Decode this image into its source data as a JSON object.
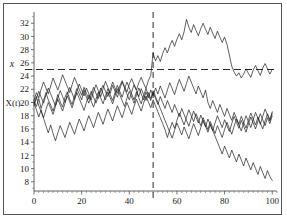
{
  "figure": {
    "background_color": "#ffffff",
    "frame_color": "#555555",
    "line_color": "#1c1c1c"
  },
  "labels": {
    "y_axis_name": "X(t)",
    "threshold_name": "x"
  },
  "chart_data": {
    "type": "line",
    "title": "",
    "xlabel": "",
    "ylabel": "X(t)",
    "xlim": [
      0,
      102
    ],
    "ylim": [
      6.6,
      33.4
    ],
    "grid": false,
    "legend": null,
    "x_ticks": [
      0,
      20,
      40,
      60,
      80,
      100
    ],
    "x_minor_tick_step": 2,
    "y_ticks": [
      8,
      10,
      12,
      14,
      16,
      18,
      20,
      22,
      24,
      26,
      28,
      30,
      32
    ],
    "y_minor_tick_step": 1,
    "annotations": [
      {
        "name": "threshold",
        "type": "hline",
        "value": 25,
        "style": "dashed",
        "label": "x"
      },
      {
        "name": "detection-time",
        "type": "vline",
        "value": 50,
        "style": "dashed",
        "label": ""
      }
    ],
    "x": [
      0,
      1,
      2,
      3,
      4,
      5,
      6,
      7,
      8,
      9,
      10,
      11,
      12,
      13,
      14,
      15,
      16,
      17,
      18,
      19,
      20,
      21,
      22,
      23,
      24,
      25,
      26,
      27,
      28,
      29,
      30,
      31,
      32,
      33,
      34,
      35,
      36,
      37,
      38,
      39,
      40,
      41,
      42,
      43,
      44,
      45,
      46,
      47,
      48,
      49,
      50,
      51,
      52,
      53,
      54,
      55,
      56,
      57,
      58,
      59,
      60,
      61,
      62,
      63,
      64,
      65,
      66,
      67,
      68,
      69,
      70,
      71,
      72,
      73,
      74,
      75,
      76,
      77,
      78,
      79,
      80,
      81,
      82,
      83,
      84,
      85,
      86,
      87,
      88,
      89,
      90,
      91,
      92,
      93,
      94,
      95,
      96,
      97,
      98,
      99,
      100
    ],
    "series": [
      {
        "name": "shifted-process",
        "values": [
          20.2,
          19.4,
          20.6,
          19.1,
          20.3,
          21.5,
          20.4,
          19.6,
          18.7,
          19.9,
          21.2,
          20.1,
          19.3,
          20.8,
          21.6,
          20.5,
          19.7,
          21.0,
          22.1,
          21.3,
          20.4,
          21.9,
          20.8,
          19.9,
          21.1,
          22.3,
          21.4,
          20.6,
          21.8,
          22.6,
          21.7,
          20.9,
          22.0,
          23.1,
          22.2,
          21.4,
          22.5,
          23.3,
          22.4,
          21.6,
          22.8,
          23.6,
          22.7,
          21.9,
          23.0,
          23.8,
          22.9,
          22.1,
          23.3,
          24.1,
          27.5,
          26.3,
          27.1,
          26.2,
          27.4,
          28.3,
          27.5,
          28.6,
          29.4,
          28.5,
          29.6,
          30.4,
          29.5,
          30.7,
          32.6,
          31.4,
          30.6,
          31.8,
          30.9,
          30.1,
          31.2,
          32.0,
          31.1,
          30.3,
          31.4,
          30.5,
          29.7,
          30.8,
          29.9,
          29.1,
          29.9,
          28.8,
          27.2,
          25.5,
          24.6,
          24.0,
          24.5,
          23.7,
          24.3,
          25.1,
          24.4,
          23.8,
          24.9,
          25.6,
          24.8,
          24.1,
          25.2,
          25.9,
          25.1,
          24.3,
          25.0
        ]
      },
      {
        "name": "in-control-a",
        "values": [
          20.3,
          21.5,
          20.7,
          22.0,
          23.1,
          22.2,
          21.3,
          22.5,
          23.7,
          22.8,
          21.9,
          23.0,
          24.2,
          23.3,
          22.4,
          21.5,
          22.7,
          23.8,
          22.9,
          22.0,
          21.1,
          22.3,
          21.4,
          20.5,
          21.7,
          20.8,
          19.9,
          21.0,
          22.2,
          21.3,
          20.4,
          21.6,
          20.7,
          19.8,
          21.0,
          22.1,
          21.2,
          20.3,
          19.4,
          20.6,
          21.7,
          20.8,
          19.9,
          21.1,
          22.2,
          21.3,
          20.4,
          21.6,
          20.7,
          21.9,
          21.0,
          22.2,
          21.3,
          22.5,
          21.6,
          20.7,
          21.9,
          23.0,
          22.1,
          21.2,
          22.4,
          23.5,
          22.6,
          21.7,
          22.9,
          24.0,
          23.1,
          22.2,
          21.3,
          22.5,
          21.6,
          20.7,
          21.9,
          20.0,
          19.1,
          20.3,
          19.4,
          18.5,
          19.7,
          18.8,
          17.9,
          19.1,
          18.2,
          17.3,
          18.5,
          17.6,
          16.7,
          17.9,
          17.0,
          16.1,
          17.3,
          18.4,
          17.5,
          16.6,
          17.8,
          16.9,
          16.0,
          17.2,
          18.3,
          17.4,
          18.6
        ]
      },
      {
        "name": "in-control-b",
        "values": [
          19.8,
          20.9,
          19.5,
          18.6,
          17.7,
          18.9,
          20.0,
          19.1,
          18.2,
          19.4,
          20.5,
          19.6,
          18.7,
          19.9,
          21.0,
          20.1,
          19.2,
          20.4,
          21.5,
          20.6,
          19.7,
          18.8,
          20.0,
          21.1,
          20.2,
          19.3,
          20.5,
          21.6,
          20.7,
          19.8,
          21.0,
          22.1,
          21.2,
          20.3,
          21.5,
          22.6,
          21.7,
          20.8,
          22.0,
          23.1,
          22.2,
          21.3,
          20.4,
          21.6,
          20.7,
          19.8,
          21.0,
          22.1,
          21.2,
          20.3,
          21.5,
          20.6,
          19.7,
          20.9,
          20.0,
          19.1,
          20.3,
          19.4,
          18.5,
          19.7,
          18.8,
          17.9,
          19.1,
          18.2,
          17.3,
          16.4,
          17.6,
          18.7,
          17.8,
          16.9,
          18.1,
          17.2,
          16.3,
          17.5,
          16.6,
          15.7,
          16.9,
          18.0,
          17.1,
          16.2,
          17.4,
          16.5,
          15.6,
          16.8,
          17.9,
          17.0,
          16.1,
          17.3,
          16.4,
          15.5,
          16.7,
          17.8,
          16.9,
          16.0,
          17.2,
          18.3,
          17.4,
          16.5,
          17.7,
          16.8,
          18.0
        ]
      },
      {
        "name": "in-control-c",
        "values": [
          20.0,
          18.9,
          17.8,
          18.9,
          17.6,
          16.5,
          15.4,
          16.6,
          15.3,
          14.2,
          15.4,
          16.5,
          15.6,
          14.7,
          15.9,
          17.0,
          16.1,
          15.2,
          16.4,
          17.5,
          16.6,
          15.7,
          16.9,
          18.0,
          17.1,
          16.2,
          17.4,
          18.5,
          17.6,
          16.7,
          17.9,
          19.0,
          18.1,
          17.2,
          18.4,
          19.5,
          18.6,
          17.7,
          18.9,
          20.0,
          19.1,
          18.2,
          19.4,
          20.5,
          19.6,
          18.7,
          19.9,
          21.0,
          20.1,
          19.2,
          20.4,
          19.5,
          18.6,
          17.7,
          16.8,
          15.9,
          14.7,
          15.9,
          17.0,
          16.1,
          17.3,
          18.4,
          17.5,
          16.6,
          17.8,
          18.9,
          18.0,
          17.1,
          18.3,
          17.4,
          16.5,
          17.7,
          16.8,
          15.9,
          17.1,
          16.2,
          15.3,
          16.5,
          15.6,
          14.7,
          15.9,
          17.0,
          16.1,
          15.2,
          16.4,
          17.5,
          16.6,
          15.7,
          16.9,
          18.0,
          17.1,
          16.2,
          17.4,
          18.5,
          17.6,
          16.7,
          17.9,
          19.0,
          18.1,
          17.2,
          18.4
        ]
      },
      {
        "name": "declining",
        "values": [
          19.5,
          20.6,
          21.7,
          20.8,
          19.9,
          21.1,
          22.2,
          21.3,
          20.4,
          19.5,
          20.7,
          21.8,
          20.9,
          20.0,
          21.2,
          22.3,
          21.4,
          20.5,
          21.7,
          22.8,
          21.9,
          21.0,
          22.2,
          21.3,
          20.4,
          21.6,
          22.7,
          21.8,
          20.9,
          22.1,
          23.2,
          22.3,
          21.4,
          22.6,
          21.7,
          20.8,
          22.0,
          23.1,
          22.2,
          21.3,
          20.4,
          21.6,
          22.7,
          21.8,
          20.9,
          22.1,
          21.2,
          20.3,
          21.5,
          20.6,
          21.8,
          20.9,
          20.0,
          19.1,
          18.2,
          17.3,
          16.4,
          15.5,
          14.6,
          15.8,
          16.9,
          16.0,
          15.1,
          16.3,
          15.4,
          14.5,
          15.7,
          16.8,
          15.9,
          15.0,
          16.2,
          17.3,
          16.4,
          15.5,
          16.7,
          15.8,
          14.9,
          14.0,
          13.1,
          12.2,
          13.4,
          12.5,
          11.6,
          12.8,
          11.9,
          11.0,
          12.2,
          11.3,
          10.4,
          11.6,
          10.7,
          9.8,
          10.9,
          10.0,
          9.1,
          10.3,
          9.4,
          8.5,
          9.7,
          8.8,
          8.2
        ]
      }
    ]
  }
}
